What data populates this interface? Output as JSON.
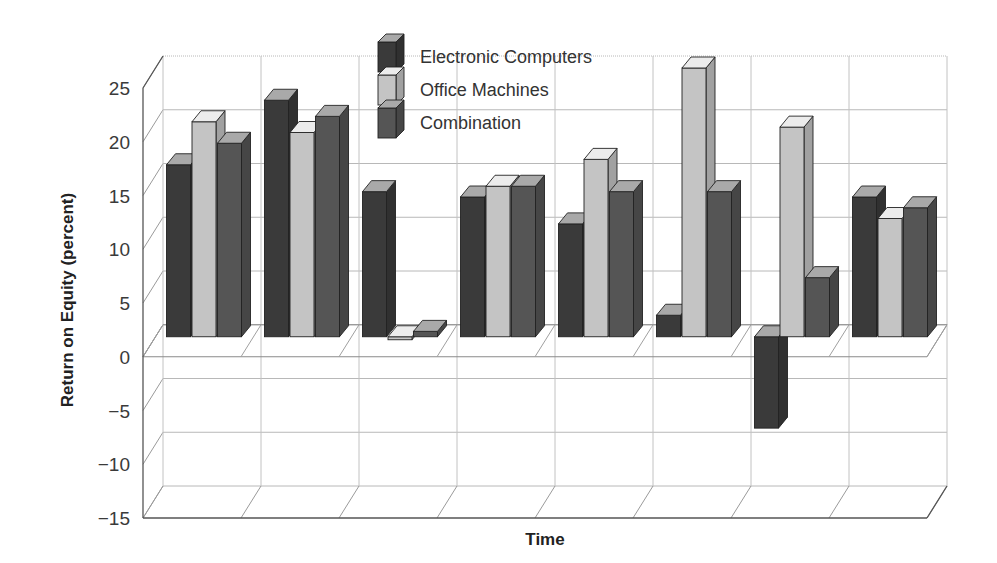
{
  "chart_data": {
    "type": "bar",
    "style": "3d-clustered-column",
    "title": "",
    "xlabel": "Time",
    "ylabel": "Return on Equity (percent)",
    "ylim": [
      -15,
      25
    ],
    "yticks": [
      25,
      20,
      15,
      10,
      5,
      0,
      -5,
      -10,
      -15
    ],
    "ytick_labels": [
      "25",
      "20",
      "15",
      "10",
      "5",
      "0",
      "−5",
      "−10",
      "−15"
    ],
    "grid": true,
    "legend_position": "top-center",
    "categories": [
      "1",
      "2",
      "3",
      "4",
      "5",
      "6",
      "7",
      "8"
    ],
    "category_labels_visible": false,
    "series": [
      {
        "name": "Electronic Computers",
        "color": "#3a3a3a",
        "values": [
          16,
          22,
          13.5,
          13,
          10.5,
          2,
          -8.5,
          13
        ]
      },
      {
        "name": "Office Machines",
        "color": "#c4c4c4",
        "values": [
          20,
          19,
          0,
          14,
          16.5,
          25,
          19.5,
          11
        ]
      },
      {
        "name": "Combination",
        "color": "#555555",
        "values": [
          18,
          20.5,
          0.5,
          14,
          13.5,
          13.5,
          5.5,
          12
        ]
      }
    ]
  },
  "legend": {
    "items": [
      {
        "label": "Electronic Computers"
      },
      {
        "label": "Office Machines"
      },
      {
        "label": "Combination"
      }
    ]
  },
  "axes": {
    "y_title": "Return on Equity (percent)",
    "x_title": "Time"
  }
}
